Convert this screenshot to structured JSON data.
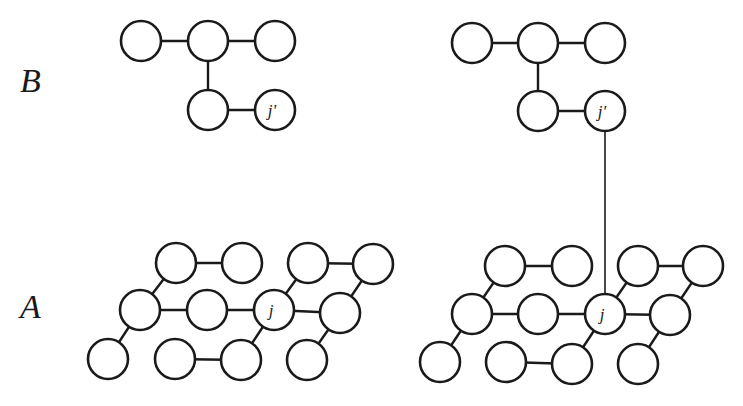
{
  "labels": {
    "top_layer": "B",
    "bottom_layer": "A",
    "node_j": "j",
    "node_j_prime": "j'"
  },
  "colors": {
    "stroke": "#1a1a1a",
    "background": "#ffffff"
  },
  "panels": [
    {
      "name": "left-panel",
      "graph_B": {
        "nodes": [
          [
            141,
            41
          ],
          [
            208,
            41
          ],
          [
            275,
            41
          ],
          [
            208,
            110
          ],
          [
            275,
            110
          ]
        ],
        "edges": [
          [
            0,
            1
          ],
          [
            1,
            2
          ],
          [
            1,
            3
          ],
          [
            3,
            4
          ]
        ],
        "labeled": {
          "4": "j'"
        }
      },
      "graph_A": {
        "nodes": [
          [
            176,
            263
          ],
          [
            242,
            263
          ],
          [
            308,
            263
          ],
          [
            373,
            264
          ],
          [
            140,
            310
          ],
          [
            207,
            310
          ],
          [
            274,
            310
          ],
          [
            340,
            313
          ],
          [
            108,
            359
          ],
          [
            175,
            359
          ],
          [
            241,
            360
          ],
          [
            307,
            360
          ]
        ],
        "edges": [
          [
            0,
            1
          ],
          [
            2,
            3
          ],
          [
            0,
            4
          ],
          [
            4,
            5
          ],
          [
            5,
            6
          ],
          [
            6,
            7
          ],
          [
            6,
            2
          ],
          [
            3,
            7
          ],
          [
            4,
            8
          ],
          [
            9,
            10
          ],
          [
            10,
            6
          ],
          [
            11,
            7
          ]
        ],
        "labeled": {
          "6": "j"
        }
      },
      "interlayer_link": false
    },
    {
      "name": "right-panel",
      "graph_B": {
        "nodes": [
          [
            472,
            43
          ],
          [
            538,
            43
          ],
          [
            605,
            43
          ],
          [
            538,
            111
          ],
          [
            605,
            111
          ]
        ],
        "edges": [
          [
            0,
            1
          ],
          [
            1,
            2
          ],
          [
            1,
            3
          ],
          [
            3,
            4
          ]
        ],
        "labeled": {
          "4": "j'"
        }
      },
      "graph_A": {
        "nodes": [
          [
            505,
            266
          ],
          [
            572,
            266
          ],
          [
            638,
            266
          ],
          [
            703,
            266
          ],
          [
            472,
            314
          ],
          [
            538,
            314
          ],
          [
            605,
            314
          ],
          [
            670,
            315
          ],
          [
            440,
            362
          ],
          [
            506,
            362
          ],
          [
            572,
            364
          ],
          [
            638,
            364
          ]
        ],
        "edges": [
          [
            0,
            1
          ],
          [
            2,
            3
          ],
          [
            0,
            4
          ],
          [
            4,
            5
          ],
          [
            5,
            6
          ],
          [
            6,
            7
          ],
          [
            6,
            2
          ],
          [
            3,
            7
          ],
          [
            4,
            8
          ],
          [
            9,
            10
          ],
          [
            10,
            6
          ],
          [
            11,
            7
          ]
        ],
        "labeled": {
          "6": "j"
        }
      },
      "interlayer_link": true
    }
  ]
}
